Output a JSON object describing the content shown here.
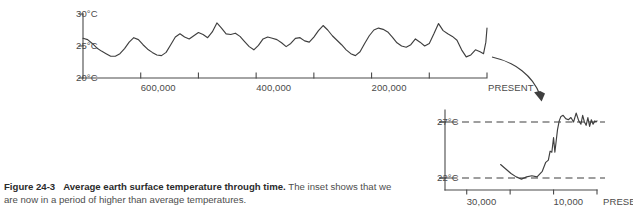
{
  "figure": {
    "number": "Figure 24-3",
    "title": "Average earth surface temperature through time.",
    "description": "The inset shows that we are now in a period of higher than average temperatures."
  },
  "colors": {
    "line": "#3f3f3f",
    "axis": "#4a4a4a",
    "text": "#4d4d4d",
    "background": "#ffffff"
  },
  "chart_data": [
    {
      "id": "main",
      "type": "line",
      "title": "Average earth surface temperature through time",
      "xlabel": "",
      "ylabel": "",
      "grid": false,
      "legend": "none",
      "x_axis_direction": "years before present, decreasing to the right",
      "ylim": [
        20,
        31.5
      ],
      "yticks": [
        20,
        25,
        30
      ],
      "ytick_labels": [
        "20°C",
        "25°C",
        "30°C"
      ],
      "xlim": [
        700000,
        0
      ],
      "xticks": [
        700000,
        600000,
        500000,
        400000,
        300000,
        200000,
        100000,
        0
      ],
      "xtick_labels": [
        "",
        "600,000",
        "",
        "400,000",
        "",
        "200,000",
        "",
        "PRESENT"
      ],
      "series": [
        {
          "name": "Average earth surface temperature",
          "units": "°C",
          "x": [
            700000,
            692000,
            684000,
            676000,
            668000,
            660000,
            652000,
            644000,
            636000,
            628000,
            620000,
            612000,
            604000,
            596000,
            588000,
            580000,
            572000,
            564000,
            556000,
            548000,
            540000,
            532000,
            524000,
            516000,
            508000,
            500000,
            492000,
            484000,
            476000,
            468000,
            460000,
            452000,
            444000,
            436000,
            428000,
            420000,
            412000,
            404000,
            396000,
            388000,
            380000,
            372000,
            364000,
            356000,
            348000,
            340000,
            332000,
            324000,
            316000,
            308000,
            300000,
            292000,
            284000,
            276000,
            268000,
            260000,
            252000,
            244000,
            236000,
            228000,
            220000,
            212000,
            204000,
            196000,
            188000,
            180000,
            172000,
            164000,
            156000,
            148000,
            140000,
            132000,
            124000,
            116000,
            108000,
            100000,
            92000,
            84000,
            76000,
            68000,
            60000,
            52000,
            44000,
            36000,
            28000,
            20000,
            12000,
            6000,
            2000,
            0
          ],
          "values": [
            26.2,
            26.0,
            25.4,
            24.7,
            24.2,
            23.8,
            23.4,
            23.4,
            23.8,
            24.6,
            25.6,
            26.3,
            26.0,
            25.2,
            24.5,
            24.0,
            23.6,
            23.5,
            24.0,
            25.2,
            26.4,
            26.9,
            26.4,
            26.1,
            26.6,
            27.1,
            26.8,
            26.3,
            27.2,
            28.6,
            27.8,
            26.9,
            26.8,
            27.0,
            26.5,
            25.7,
            24.9,
            24.4,
            25.1,
            26.1,
            26.4,
            26.2,
            26.0,
            25.5,
            24.9,
            25.4,
            26.2,
            26.3,
            25.8,
            25.6,
            26.4,
            27.4,
            28.2,
            27.5,
            26.6,
            25.9,
            25.2,
            24.4,
            23.8,
            23.5,
            24.1,
            25.4,
            26.6,
            27.5,
            27.8,
            27.6,
            27.2,
            26.4,
            25.5,
            25.0,
            24.8,
            25.2,
            26.1,
            25.6,
            25.0,
            25.4,
            26.9,
            28.5,
            27.4,
            26.9,
            26.5,
            25.9,
            24.4,
            23.3,
            23.6,
            24.4,
            24.1,
            23.8,
            25.6,
            27.8
          ]
        }
      ]
    },
    {
      "id": "inset",
      "type": "line",
      "title": "Recent temperature detail",
      "xlabel": "",
      "ylabel": "",
      "grid": false,
      "legend": "none",
      "x_axis_direction": "years before present, decreasing to the right",
      "ylim": [
        20.2,
        28.4
      ],
      "yticks": [
        22,
        27
      ],
      "ytick_labels": [
        "22°C",
        "27°C"
      ],
      "reference_lines": [
        22,
        27
      ],
      "xlim": [
        35000,
        0
      ],
      "xticks": [
        30000,
        20000,
        10000,
        0
      ],
      "xtick_labels": [
        "30,000",
        "",
        "10,000",
        "PRESENT"
      ],
      "series": [
        {
          "name": "Average earth surface temperature",
          "units": "°C",
          "x": [
            22200,
            21000,
            19800,
            18600,
            17400,
            16200,
            15000,
            13800,
            12600,
            11800,
            11200,
            10800,
            10400,
            10000,
            9700,
            9400,
            9100,
            8700,
            8300,
            7800,
            7200,
            6600,
            6000,
            5400,
            4800,
            4200,
            3700,
            3300,
            2900,
            2500,
            2100,
            1700,
            1300,
            900,
            500,
            200,
            0
          ],
          "values": [
            23.2,
            22.8,
            22.4,
            22.1,
            21.9,
            22.1,
            22.2,
            22.1,
            22.6,
            23.4,
            23.6,
            24.4,
            24.3,
            25.6,
            24.3,
            25.3,
            26.3,
            27.1,
            27.5,
            27.6,
            27.3,
            27.2,
            27.4,
            27.0,
            27.8,
            27.1,
            26.8,
            27.6,
            27.0,
            26.7,
            27.4,
            26.6,
            27.2,
            26.8,
            27.1,
            27.0,
            27.1
          ]
        }
      ]
    }
  ],
  "annotations": {
    "zoom_arrow": "curved arrow from main chart present-day region to inset"
  }
}
